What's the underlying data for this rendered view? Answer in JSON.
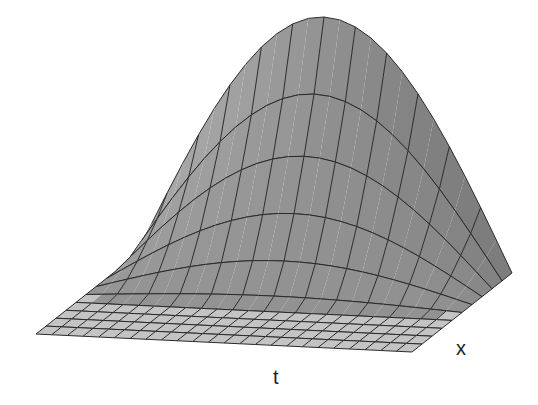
{
  "chart_data": {
    "type": "surface3d",
    "title": "",
    "xlabel": "t",
    "ylabel": "x",
    "zlabel": "",
    "grid": {
      "t_segments": 24,
      "x_segments": 10,
      "surface_t_lines_every": 2
    },
    "surface_model": {
      "form": "u = A * f(x) * sin(pi * t)",
      "x_onset": 0.42,
      "amplitude_px": 247,
      "profile_exponent": 1.6
    },
    "x_rows_heights_at_peak": [
      0,
      0,
      0,
      0,
      0.03,
      0.14,
      0.3,
      0.5,
      0.72,
      1.0
    ],
    "t": [
      0,
      0.0417,
      0.0833,
      0.125,
      0.1667,
      0.2083,
      0.25,
      0.2917,
      0.3333,
      0.375,
      0.4167,
      0.4583,
      0.5,
      0.5417,
      0.5833,
      0.625,
      0.6667,
      0.7083,
      0.75,
      0.7917,
      0.8333,
      0.875,
      0.9167,
      0.9583,
      1
    ],
    "projection": {
      "origin": [
        36,
        334
      ],
      "t_vector": [
        376,
        18
      ],
      "x_vector": [
        100,
        -79
      ],
      "z_vector": [
        0,
        -1
      ]
    },
    "colors": {
      "flat_fill": "#c4c4c4",
      "surface_light": "#aaaaaa",
      "surface_dark": "#7b7b7b",
      "grid_line": "#2a2a2a"
    }
  },
  "labels": {
    "t_axis": "t",
    "x_axis": "x"
  }
}
